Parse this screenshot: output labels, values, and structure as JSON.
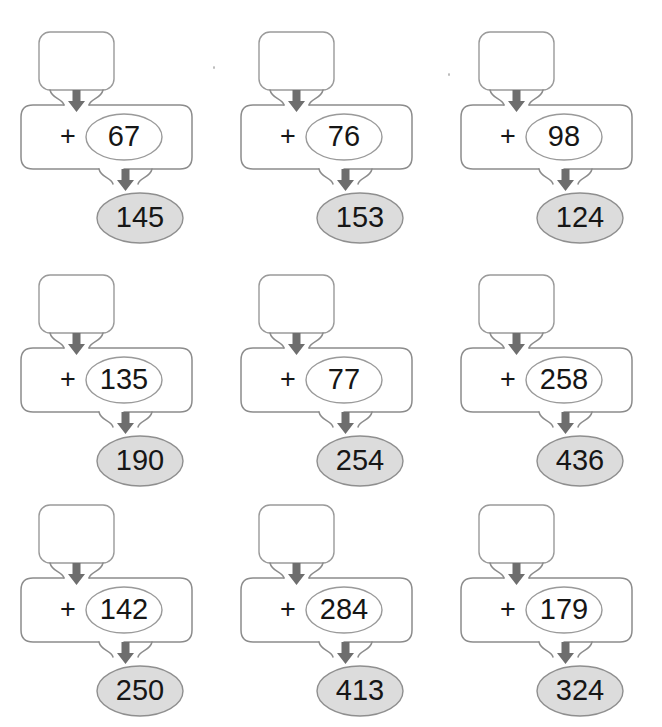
{
  "worksheet": {
    "type": "addition-function-machine",
    "operator": "+",
    "input_placeholder": "",
    "colors": {
      "outline": "#8c8c8c",
      "box_outline": "#9a9a9a",
      "arrow": "#6e6e6e",
      "result_fill": "#dcdcdc",
      "result_outline": "#8f8f8f",
      "operand_fill": "#ffffff",
      "operand_outline": "#9a9a9a",
      "text": "#161616",
      "background": "#ffffff"
    },
    "columns": 3,
    "rows": 3,
    "problems": [
      {
        "id": 1,
        "input": "",
        "operator": "+",
        "operand": "67",
        "result": "145"
      },
      {
        "id": 2,
        "input": "",
        "operator": "+",
        "operand": "76",
        "result": "153"
      },
      {
        "id": 3,
        "input": "",
        "operator": "+",
        "operand": "98",
        "result": "124"
      },
      {
        "id": 4,
        "input": "",
        "operator": "+",
        "operand": "135",
        "result": "190"
      },
      {
        "id": 5,
        "input": "",
        "operator": "+",
        "operand": "77",
        "result": "254"
      },
      {
        "id": 6,
        "input": "",
        "operator": "+",
        "operand": "258",
        "result": "436"
      },
      {
        "id": 7,
        "input": "",
        "operator": "+",
        "operand": "142",
        "result": "250"
      },
      {
        "id": 8,
        "input": "",
        "operator": "+",
        "operand": "284",
        "result": "413"
      },
      {
        "id": 9,
        "input": "",
        "operator": "+",
        "operand": "179",
        "result": "324"
      }
    ]
  }
}
